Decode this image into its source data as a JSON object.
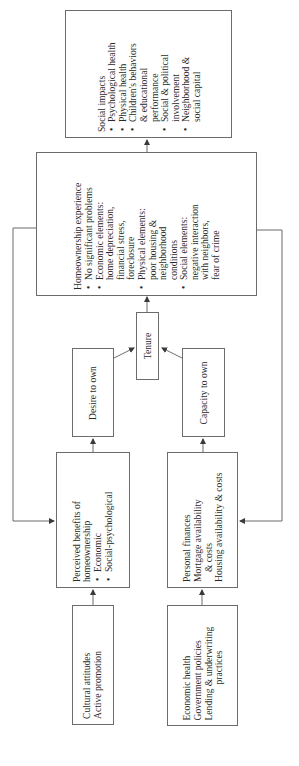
{
  "diagram": {
    "orientation": "rotated 90 degrees counter-clockwise",
    "nodes": {
      "cultural": {
        "lines": [
          "Cultural attitudes",
          "Active promotion"
        ]
      },
      "economic_context": {
        "lines": [
          "Economic health",
          "Government policies",
          "Lending & underwriting",
          "practices"
        ]
      },
      "perceived_benefits": {
        "title_lines": [
          "Perceived benefits of",
          "homeownership"
        ],
        "bullets": [
          "Economic",
          "Social-psychological"
        ]
      },
      "personal_finances": {
        "lines": [
          "Personal finances",
          "Mortgage availability",
          "& costs",
          "Housing availability & costs"
        ]
      },
      "desire": {
        "label": "Desire to own"
      },
      "capacity": {
        "label": "Capacity to own"
      },
      "tenure": {
        "label": "Tenure"
      },
      "experience": {
        "title": "Homeownership experience",
        "bullets": [
          {
            "head": "No significant problems",
            "sub": []
          },
          {
            "head": "Economic elements:",
            "sub": [
              "home depreciation,",
              "financial stress,",
              "foreclosure"
            ]
          },
          {
            "head": "Physical elements:",
            "sub": [
              "poor housing &",
              "neighborhood",
              "conditions"
            ]
          },
          {
            "head": "Social elements:",
            "sub": [
              "negative interaction",
              "with neighbors,",
              "fear of crime"
            ]
          }
        ]
      },
      "social_impacts": {
        "title": "Social impacts",
        "bullets": [
          {
            "head": "Psychological health",
            "sub": []
          },
          {
            "head": "Physical health",
            "sub": []
          },
          {
            "head": "Children's behaviors",
            "sub": [
              "& educational",
              "performance"
            ]
          },
          {
            "head": "Social & political",
            "sub": [
              "involvement"
            ]
          },
          {
            "head": "Neighborhood &",
            "sub": [
              "social capital"
            ]
          }
        ]
      }
    },
    "edges": [
      [
        "cultural",
        "perceived_benefits"
      ],
      [
        "economic_context",
        "personal_finances"
      ],
      [
        "perceived_benefits",
        "desire"
      ],
      [
        "personal_finances",
        "capacity"
      ],
      [
        "desire",
        "tenure"
      ],
      [
        "capacity",
        "tenure"
      ],
      [
        "tenure",
        "experience"
      ],
      [
        "experience",
        "social_impacts"
      ],
      [
        "experience",
        "perceived_benefits"
      ],
      [
        "experience",
        "personal_finances"
      ]
    ],
    "colors": {
      "line": "#6b6b6b",
      "text": "#2a2a2a",
      "background": "#ffffff"
    }
  }
}
